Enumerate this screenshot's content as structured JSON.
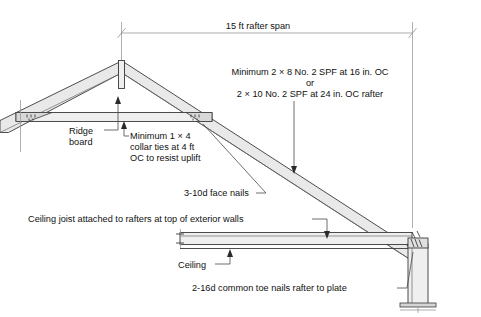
{
  "figure": {
    "type": "construction-section-diagram"
  },
  "dimensions": {
    "span_label": "15 ft rafter span"
  },
  "callouts": {
    "rafter_spec_line1": "Minimum 2 × 8 No. 2 SPF at 16 in. OC",
    "rafter_spec_line2": "or",
    "rafter_spec_line3": "2 × 10 No. 2 SPF at 24 in. OC rafter",
    "ridge_board_line1": "Ridge",
    "ridge_board_line2": "board",
    "collar_tie_line1": "Minimum 1 × 4",
    "collar_tie_line2": "collar ties at 4 ft",
    "collar_tie_line3": "OC to resist uplift",
    "face_nails": "3-10d face nails",
    "ceiling_joist": "Ceiling joist attached to rafters at top of exterior walls",
    "ceiling": "Ceiling",
    "toe_nails": "2-16d common toe nails rafter to plate"
  },
  "colors": {
    "background": "#ffffff",
    "wood_fill": "#e9e9e9",
    "outline": "#3a3a3a",
    "dimension_line": "#8a8a8a",
    "text": "#111111"
  },
  "parts": [
    {
      "name": "ridge-board",
      "label": "Ridge board"
    },
    {
      "name": "left-rafter",
      "label": "Left rafter"
    },
    {
      "name": "right-rafter",
      "label": "Right rafter"
    },
    {
      "name": "collar-tie",
      "label": "Collar tie"
    },
    {
      "name": "ceiling-joist",
      "label": "Ceiling joist"
    },
    {
      "name": "ceiling-line",
      "label": "Ceiling"
    },
    {
      "name": "exterior-wall",
      "label": "Exterior wall"
    },
    {
      "name": "wall-base-plate",
      "label": "Base plate"
    }
  ]
}
